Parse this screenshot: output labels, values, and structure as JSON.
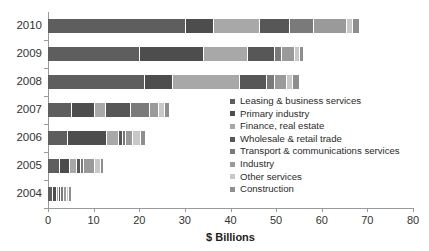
{
  "chart_data": {
    "type": "bar",
    "orientation": "horizontal",
    "stacked": true,
    "title": "",
    "xlabel": "$ Billions",
    "ylabel": "",
    "xlim": [
      0,
      80
    ],
    "xticks": [
      0,
      10,
      20,
      30,
      40,
      50,
      60,
      70,
      80
    ],
    "grid": false,
    "legend_position": "inside-right",
    "categories": [
      "2010",
      "2009",
      "2008",
      "2007",
      "2006",
      "2005",
      "2004"
    ],
    "series": [
      {
        "name": "Leasing & business services",
        "color": "#5e5e5e",
        "values": [
          30.2,
          20.2,
          21.3,
          5.2,
          4.4,
          2.6,
          1.1
        ]
      },
      {
        "name": "Primary industry",
        "color": "#4d4d4d",
        "values": [
          6.2,
          13.9,
          6.2,
          5.0,
          8.6,
          2.2,
          0.8
        ]
      },
      {
        "name": "Finance, real estate",
        "color": "#a8a8a8",
        "values": [
          10.0,
          9.8,
          14.6,
          2.5,
          2.6,
          1.6,
          0.5
        ]
      },
      {
        "name": "Wholesale & retail trade",
        "color": "#575757",
        "values": [
          6.6,
          5.8,
          5.8,
          5.6,
          0.9,
          0.9,
          0.5
        ]
      },
      {
        "name": "Transport & communications services",
        "color": "#7a7a7a",
        "values": [
          5.3,
          1.5,
          1.8,
          4.0,
          0.6,
          0.5,
          0.5
        ]
      },
      {
        "name": "Industry",
        "color": "#9a9a9a",
        "values": [
          7.2,
          3.0,
          2.7,
          2.1,
          1.6,
          2.6,
          0.7
        ]
      },
      {
        "name": "Other services",
        "color": "#c8c8c8",
        "values": [
          1.4,
          1.0,
          1.4,
          1.3,
          1.6,
          1.2,
          0.5
        ]
      },
      {
        "name": "Construction",
        "color": "#8e8e8e",
        "values": [
          1.3,
          0.8,
          1.2,
          0.8,
          0.9,
          0.5,
          0.4
        ]
      }
    ],
    "totals": [
      68.2,
      56.0,
      55.0,
      26.5,
      21.2,
      12.1,
      5.0
    ]
  },
  "axis": {
    "x_title": "$ Billions",
    "x_tick_labels": [
      "0",
      "10",
      "20",
      "30",
      "40",
      "50",
      "60",
      "70",
      "80"
    ],
    "y_tick_labels": [
      "2010",
      "2009",
      "2008",
      "2007",
      "2006",
      "2005",
      "2004"
    ]
  },
  "legend": {
    "items": [
      {
        "label": "Leasing & business services",
        "color": "#5e5e5e"
      },
      {
        "label": "Primary industry",
        "color": "#4d4d4d"
      },
      {
        "label": "Finance, real estate",
        "color": "#a8a8a8"
      },
      {
        "label": "Wholesale & retail trade",
        "color": "#575757"
      },
      {
        "label": "Transport & communications services",
        "color": "#7a7a7a"
      },
      {
        "label": "Industry",
        "color": "#9a9a9a"
      },
      {
        "label": "Other services",
        "color": "#c8c8c8"
      },
      {
        "label": "Construction",
        "color": "#8e8e8e"
      }
    ]
  }
}
